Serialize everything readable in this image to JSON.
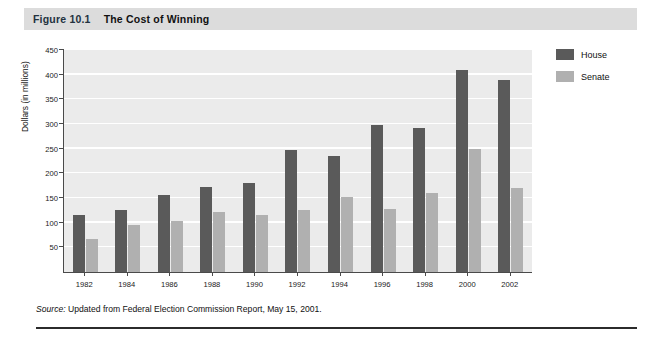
{
  "figure": {
    "number": "Figure 10.1",
    "title": "The Cost of Winning"
  },
  "source_note": {
    "label": "Source:",
    "text": " Updated from Federal Election Commission Report, May 15, 2001."
  },
  "legend": {
    "position": "right",
    "items": [
      {
        "label": "House",
        "color": "#5a5a5a"
      },
      {
        "label": "Senate",
        "color": "#b0b0b0"
      }
    ]
  },
  "colors": {
    "house": "#5a5a5a",
    "senate": "#b0b0b0",
    "plot_background": "#ebebeb",
    "gridline": "#ffffff",
    "axis": "#4a4a4a",
    "title_band": "#dcdcdc",
    "rule": "#2b2b2b"
  },
  "chart_data": {
    "type": "bar",
    "title": "The Cost of Winning",
    "xlabel": "",
    "ylabel": "Dollars (in millions)",
    "ylim": [
      0,
      450
    ],
    "ytick_step": 50,
    "yticks": [
      50,
      100,
      150,
      200,
      250,
      300,
      350,
      400,
      450
    ],
    "ytick_labels": [
      "50",
      "100",
      "150",
      "200",
      "250",
      "300",
      "350",
      "400",
      "450"
    ],
    "grid": true,
    "legend_position": "right",
    "categories": [
      "1982",
      "1984",
      "1986",
      "1988",
      "1990",
      "1992",
      "1994",
      "1996",
      "1998",
      "2000",
      "2002"
    ],
    "series": [
      {
        "name": "House",
        "color": "#5a5a5a",
        "values": [
          115,
          125,
          157,
          173,
          180,
          248,
          235,
          298,
          292,
          410,
          390
        ]
      },
      {
        "name": "Senate",
        "color": "#b0b0b0",
        "values": [
          67,
          95,
          103,
          122,
          115,
          126,
          152,
          128,
          160,
          250,
          170
        ]
      }
    ]
  }
}
